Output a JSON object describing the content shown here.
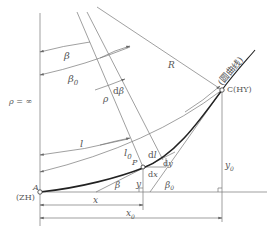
{
  "diagram": {
    "type": "transition-curve-geometry",
    "labels": {
      "rho_inf": "ρ = ∞",
      "beta": "β",
      "beta0": "β",
      "beta0_sub": "0",
      "rho": "ρ",
      "dbeta": "dβ",
      "R": "R",
      "circular_curve": "(圆曲线)",
      "C": "C(HY)",
      "l": "l",
      "l0": "l",
      "l0_sub": "0",
      "dl": "dl",
      "P": "P",
      "dy": "dy",
      "dx": "dx",
      "y": "y",
      "y0": "y",
      "y0_sub": "0",
      "beta_small": "β",
      "beta0_small": "β",
      "beta0_small_sub": "0",
      "A": "A",
      "ZH": "(ZH)",
      "x": "x",
      "x0": "x",
      "x0_sub": "0"
    },
    "colors": {
      "line": "#777777",
      "curve": "#222222",
      "text": "#555555",
      "background": "#ffffff"
    }
  }
}
